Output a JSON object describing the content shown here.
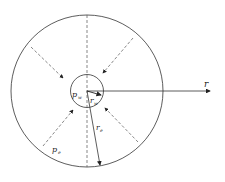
{
  "diagram": {
    "labels": {
      "r_axis": "r",
      "pw": "p",
      "pw_sub": "w",
      "rw": "r",
      "rw_sub": "w",
      "re": "r",
      "re_sub": "e",
      "pe": "p",
      "pe_sub": "e"
    },
    "colors": {
      "stroke": "#333333",
      "dashed": "#555555"
    }
  }
}
